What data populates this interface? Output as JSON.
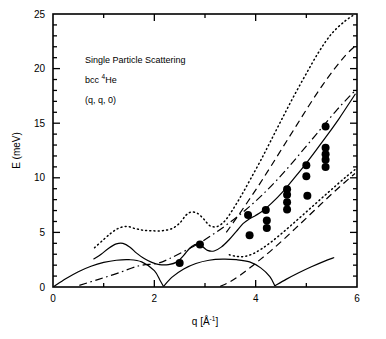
{
  "figure": {
    "background": "#ffffff",
    "ink": "#000000"
  },
  "annotations": {
    "line1": "Single Particle Scattering",
    "line2_pre": "bcc ",
    "line2_sup": "4",
    "line2_post": "He",
    "line3": "(q, q, 0)"
  },
  "axes": {
    "xlabel_pre": "q [Å",
    "xlabel_sup": "-1",
    "xlabel_post": "]",
    "ylabel": "E (meV)",
    "xticks_major": [
      "0",
      "2",
      "4",
      "6"
    ],
    "xticks_major_values": [
      0,
      2,
      4,
      6
    ],
    "xticks_minor_values": [
      1,
      3,
      5
    ],
    "yticks_major": [
      "0",
      "5",
      "10",
      "15",
      "20",
      "25"
    ],
    "yticks_major_values": [
      0,
      5,
      10,
      15,
      20,
      25
    ]
  },
  "chart_data": {
    "type": "scatter",
    "title": "Single Particle Scattering",
    "subtitle": "bcc 4He  (q, q, 0)",
    "xlabel": "q [Å-1]",
    "ylabel": "E (meV)",
    "xlim": [
      0,
      6
    ],
    "ylim": [
      0,
      25
    ],
    "grid": false,
    "legend": "none",
    "annotations": [
      "Single Particle Scattering",
      "bcc 4He",
      "(q, q, 0)"
    ],
    "series": [
      {
        "name": "Measured single particle excitations",
        "style": "filled-circle-markers",
        "marker": "o",
        "color": "#000000",
        "points": [
          [
            2.5,
            2.2
          ],
          [
            2.9,
            3.9
          ],
          [
            3.85,
            6.6
          ],
          [
            3.88,
            4.75
          ],
          [
            4.2,
            7.05
          ],
          [
            4.22,
            6.1
          ],
          [
            4.22,
            5.4
          ],
          [
            4.62,
            8.95
          ],
          [
            4.62,
            8.45
          ],
          [
            4.62,
            7.75
          ],
          [
            4.62,
            7.1
          ],
          [
            5.0,
            11.15
          ],
          [
            5.0,
            10.15
          ],
          [
            5.02,
            8.35
          ],
          [
            5.38,
            14.7
          ],
          [
            5.38,
            12.75
          ],
          [
            5.38,
            12.15
          ],
          [
            5.38,
            11.65
          ],
          [
            5.38,
            11.0
          ]
        ]
      },
      {
        "name": "Upper dotted boundary",
        "style": "dotted",
        "color": "#000000",
        "points": [
          [
            0.82,
            3.6
          ],
          [
            1.0,
            4.35
          ],
          [
            1.15,
            4.95
          ],
          [
            1.28,
            5.35
          ],
          [
            1.45,
            5.55
          ],
          [
            1.62,
            5.35
          ],
          [
            1.78,
            5.2
          ],
          [
            1.95,
            5.15
          ],
          [
            2.15,
            5.15
          ],
          [
            2.35,
            5.35
          ],
          [
            2.5,
            5.85
          ],
          [
            2.62,
            6.55
          ],
          [
            2.72,
            6.85
          ],
          [
            2.85,
            6.75
          ],
          [
            2.98,
            6.2
          ],
          [
            3.1,
            5.6
          ],
          [
            3.25,
            5.55
          ],
          [
            3.4,
            6.1
          ],
          [
            3.55,
            7.1
          ],
          [
            3.72,
            8.4
          ],
          [
            3.9,
            9.9
          ],
          [
            4.1,
            11.6
          ],
          [
            4.3,
            13.4
          ],
          [
            4.52,
            15.4
          ],
          [
            4.75,
            17.45
          ],
          [
            5.0,
            19.55
          ],
          [
            5.25,
            21.55
          ],
          [
            5.5,
            23.2
          ],
          [
            5.75,
            24.3
          ],
          [
            5.95,
            24.95
          ]
        ]
      },
      {
        "name": "Upper dashed curve",
        "style": "dashed",
        "color": "#000000",
        "points": [
          [
            3.42,
            5.0
          ],
          [
            3.62,
            6.3
          ],
          [
            3.85,
            7.85
          ],
          [
            4.08,
            9.45
          ],
          [
            4.3,
            11.05
          ],
          [
            4.55,
            12.9
          ],
          [
            4.8,
            14.75
          ],
          [
            5.05,
            16.6
          ],
          [
            5.3,
            18.35
          ],
          [
            5.55,
            19.95
          ],
          [
            5.78,
            21.25
          ],
          [
            5.96,
            22.05
          ]
        ]
      },
      {
        "name": "Dash-dot curve",
        "style": "dashdot",
        "color": "#000000",
        "points": [
          [
            0.52,
            0.15
          ],
          [
            0.9,
            0.7
          ],
          [
            1.3,
            1.3
          ],
          [
            1.7,
            1.95
          ],
          [
            2.05,
            2.15
          ],
          [
            2.3,
            2.6
          ],
          [
            2.6,
            3.3
          ],
          [
            2.9,
            4.05
          ],
          [
            3.2,
            4.95
          ],
          [
            3.5,
            5.95
          ],
          [
            3.8,
            7.05
          ],
          [
            4.1,
            8.3
          ],
          [
            4.4,
            9.7
          ],
          [
            4.7,
            11.25
          ],
          [
            5.0,
            12.9
          ],
          [
            5.3,
            14.55
          ],
          [
            5.6,
            16.2
          ],
          [
            5.85,
            17.45
          ],
          [
            5.97,
            18.0
          ]
        ]
      },
      {
        "name": "Main solid response curve",
        "style": "solid",
        "color": "#000000",
        "points": [
          [
            0.8,
            2.55
          ],
          [
            0.95,
            3.0
          ],
          [
            1.1,
            3.55
          ],
          [
            1.25,
            3.95
          ],
          [
            1.38,
            4.0
          ],
          [
            1.52,
            3.65
          ],
          [
            1.65,
            3.1
          ],
          [
            1.8,
            2.6
          ],
          [
            1.95,
            2.25
          ],
          [
            2.1,
            2.05
          ],
          [
            2.28,
            2.05
          ],
          [
            2.45,
            2.3
          ],
          [
            2.58,
            2.9
          ],
          [
            2.7,
            3.55
          ],
          [
            2.82,
            3.9
          ],
          [
            2.95,
            3.7
          ],
          [
            3.05,
            3.35
          ],
          [
            3.18,
            3.3
          ],
          [
            3.32,
            3.65
          ],
          [
            3.48,
            4.35
          ],
          [
            3.62,
            5.1
          ],
          [
            3.75,
            5.8
          ],
          [
            3.88,
            6.25
          ],
          [
            4.0,
            6.55
          ],
          [
            4.15,
            7.0
          ],
          [
            4.32,
            7.7
          ],
          [
            4.52,
            8.65
          ],
          [
            4.72,
            9.75
          ],
          [
            4.95,
            11.05
          ],
          [
            5.18,
            12.45
          ],
          [
            5.42,
            13.95
          ],
          [
            5.65,
            15.45
          ],
          [
            5.85,
            16.85
          ],
          [
            5.97,
            17.7
          ]
        ]
      },
      {
        "name": "Lower dotted boundary",
        "style": "dotted",
        "color": "#000000",
        "points": [
          [
            3.48,
            2.95
          ],
          [
            3.62,
            2.8
          ],
          [
            3.78,
            2.8
          ],
          [
            3.95,
            3.05
          ],
          [
            4.12,
            3.5
          ],
          [
            4.3,
            4.1
          ],
          [
            4.5,
            4.85
          ],
          [
            4.7,
            5.65
          ],
          [
            4.92,
            6.55
          ],
          [
            5.15,
            7.5
          ],
          [
            5.38,
            8.45
          ],
          [
            5.6,
            9.35
          ],
          [
            5.8,
            10.15
          ],
          [
            5.96,
            10.75
          ]
        ]
      },
      {
        "name": "Lower dashed boundary",
        "style": "dashed",
        "color": "#000000",
        "points": [
          [
            3.3,
            0.05
          ],
          [
            3.5,
            0.5
          ],
          [
            3.7,
            1.1
          ],
          [
            3.9,
            1.8
          ],
          [
            4.1,
            2.55
          ],
          [
            4.32,
            3.4
          ],
          [
            4.55,
            4.35
          ],
          [
            4.78,
            5.35
          ],
          [
            5.02,
            6.4
          ],
          [
            5.28,
            7.55
          ],
          [
            5.52,
            8.6
          ],
          [
            5.75,
            9.55
          ],
          [
            5.96,
            10.4
          ]
        ]
      },
      {
        "name": "Phonon branch arch 1",
        "style": "solid",
        "color": "#000000",
        "points": [
          [
            0.02,
            0.05
          ],
          [
            0.25,
            0.75
          ],
          [
            0.5,
            1.4
          ],
          [
            0.75,
            1.9
          ],
          [
            1.0,
            2.25
          ],
          [
            1.25,
            2.45
          ],
          [
            1.5,
            2.5
          ],
          [
            1.75,
            2.3
          ],
          [
            2.0,
            1.5
          ],
          [
            2.12,
            0.55
          ],
          [
            2.18,
            0.05
          ]
        ]
      },
      {
        "name": "Phonon branch arch 2",
        "style": "solid",
        "color": "#000000",
        "points": [
          [
            2.18,
            0.05
          ],
          [
            2.35,
            0.9
          ],
          [
            2.58,
            1.65
          ],
          [
            2.82,
            2.15
          ],
          [
            3.08,
            2.45
          ],
          [
            3.35,
            2.55
          ],
          [
            3.62,
            2.5
          ],
          [
            3.88,
            2.3
          ],
          [
            4.1,
            1.75
          ],
          [
            4.28,
            0.95
          ],
          [
            4.38,
            0.1
          ]
        ]
      },
      {
        "name": "Phonon branch arch 3 rising",
        "style": "solid",
        "color": "#000000",
        "points": [
          [
            4.38,
            0.1
          ],
          [
            4.6,
            0.7
          ],
          [
            4.85,
            1.3
          ],
          [
            5.1,
            1.85
          ],
          [
            5.35,
            2.35
          ],
          [
            5.55,
            2.7
          ]
        ]
      }
    ]
  }
}
